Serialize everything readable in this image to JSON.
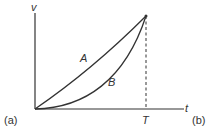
{
  "diagram": {
    "axis_labels": {
      "y": "v",
      "x": "t"
    },
    "tick_labels": {
      "T": "T"
    },
    "curves": [
      {
        "name": "A",
        "label": "A",
        "shape": "nearly straight line from origin to (T, vmax)"
      },
      {
        "name": "B",
        "label": "B",
        "shape": "concave-up curve from origin to (T, vmax)"
      }
    ],
    "panel_labels": {
      "left": "(a)",
      "right": "(b)"
    },
    "colors": {
      "stroke": "#333333",
      "background": "#ffffff"
    }
  }
}
